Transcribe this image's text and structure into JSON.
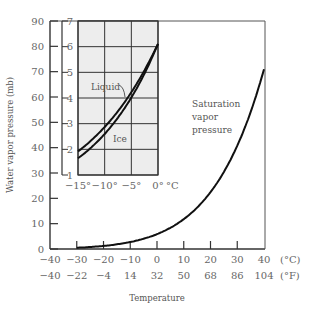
{
  "chart_data": [
    {
      "type": "line",
      "title": "",
      "xlabel": "Temperature",
      "ylabel": "Water vapor pressure (mb)",
      "x_unit_primary": "(°C)",
      "x_unit_secondary": "(°F)",
      "xlim": [
        -40,
        40
      ],
      "ylim": [
        0,
        90
      ],
      "x_ticks_c": [
        "-40",
        "-30",
        "-20",
        "-10",
        "0",
        "10",
        "20",
        "30",
        "40"
      ],
      "x_ticks_f": [
        "-40",
        "-22",
        "-4",
        "14",
        "32",
        "50",
        "68",
        "86",
        "104"
      ],
      "y_ticks": [
        "0",
        "10",
        "20",
        "30",
        "40",
        "50",
        "60",
        "70",
        "80",
        "90"
      ],
      "grid": false,
      "annotations": [
        "Saturation",
        "vapor",
        "pressure"
      ],
      "series": [
        {
          "name": "Saturation vapor pressure",
          "x": [
            -30,
            -25,
            -20,
            -15,
            -10,
            -5,
            0,
            5,
            10,
            15,
            20,
            25,
            30,
            35,
            40
          ],
          "values": [
            0.5,
            0.8,
            1.3,
            1.9,
            2.9,
            4.2,
            6.1,
            8.7,
            12.3,
            17.0,
            23.4,
            31.7,
            42.4,
            56.2,
            73.8
          ]
        }
      ]
    },
    {
      "type": "line",
      "title": "Inset",
      "xlabel": "°C",
      "ylabel": "",
      "xlim": [
        -15,
        0
      ],
      "ylim": [
        1,
        7
      ],
      "x_ticks": [
        "−15°",
        "−10°",
        "−5°",
        "0°"
      ],
      "x_unit": "°C",
      "y_ticks": [
        "1",
        "2",
        "3",
        "4",
        "5",
        "6",
        "7"
      ],
      "grid": true,
      "series": [
        {
          "name": "Liquid",
          "x": [
            -15,
            -12.5,
            -10,
            -7.5,
            -5,
            -2.5,
            0
          ],
          "values": [
            1.9,
            2.4,
            2.9,
            3.5,
            4.2,
            5.1,
            6.1
          ]
        },
        {
          "name": "Ice",
          "x": [
            -15,
            -12.5,
            -10,
            -7.5,
            -5,
            -2.5,
            0
          ],
          "values": [
            1.65,
            2.1,
            2.6,
            3.3,
            4.0,
            5.0,
            6.1
          ]
        }
      ]
    }
  ]
}
